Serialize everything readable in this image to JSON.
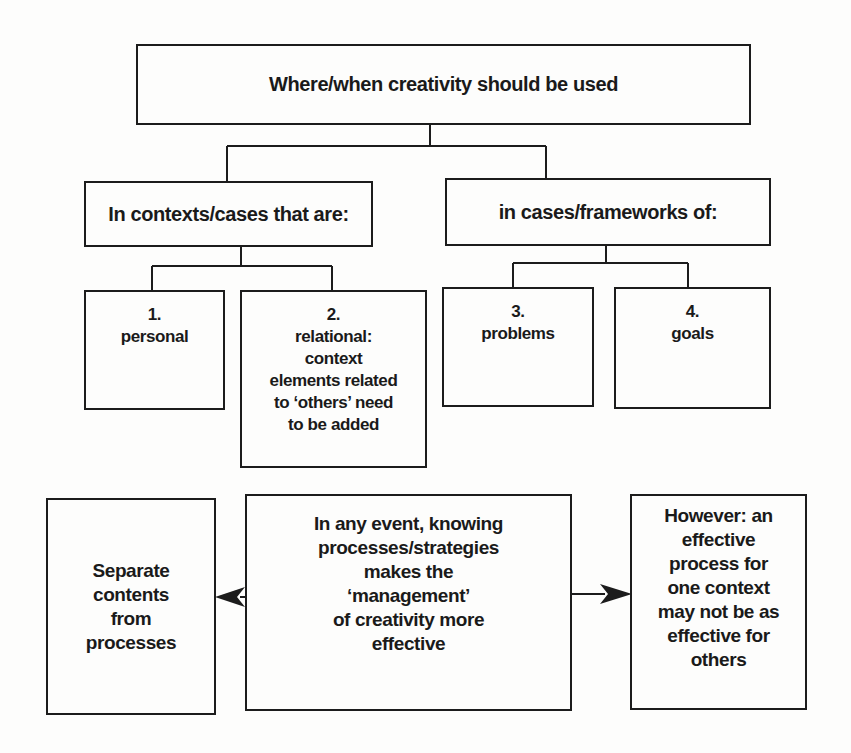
{
  "diagram": {
    "root": {
      "label": "Where/when creativity should be used"
    },
    "branches": [
      {
        "label": "In contexts/cases that are:",
        "children": [
          {
            "number": "1.",
            "lines": [
              "personal"
            ]
          },
          {
            "number": "2.",
            "lines": [
              "relational:",
              "context",
              "elements related",
              "to ‘others’ need",
              "to be added"
            ]
          }
        ]
      },
      {
        "label": "in cases/frameworks of:",
        "children": [
          {
            "number": "3.",
            "lines": [
              "problems"
            ]
          },
          {
            "number": "4.",
            "lines": [
              "goals"
            ]
          }
        ]
      }
    ],
    "bottom": {
      "left": {
        "lines": [
          "Separate",
          "contents",
          "from",
          "processes"
        ]
      },
      "center": {
        "lines": [
          "In any event, knowing",
          "processes/strategies",
          "makes the",
          "‘management’",
          "of creativity more",
          "effective"
        ]
      },
      "right": {
        "lines": [
          "However: an",
          "effective",
          "process for",
          "one context",
          "may not be as",
          "effective for",
          "others"
        ]
      }
    },
    "arrows": [
      {
        "from": "center",
        "to": "left"
      },
      {
        "from": "center",
        "to": "right"
      }
    ]
  }
}
